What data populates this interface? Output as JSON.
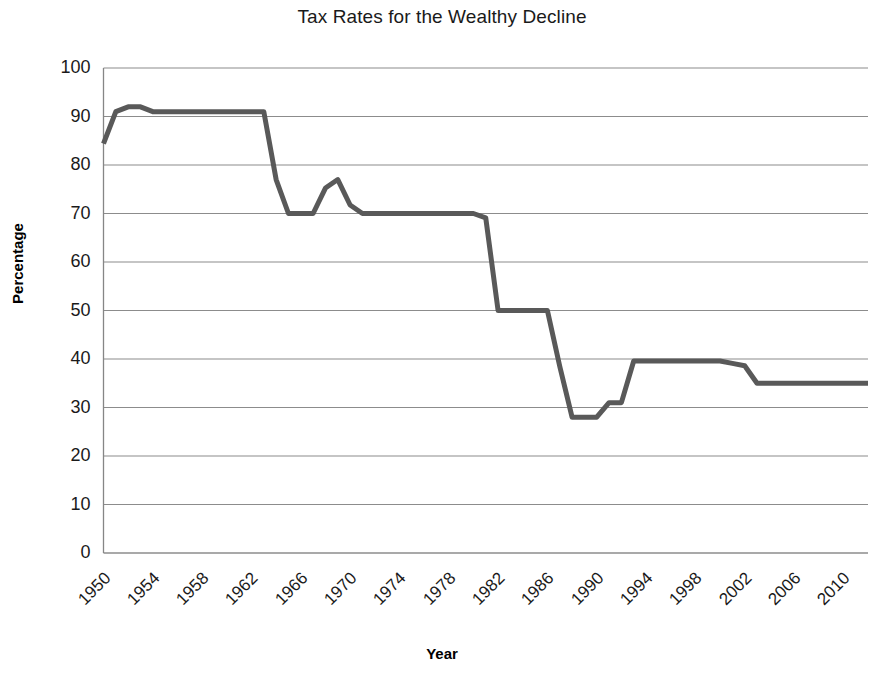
{
  "chart_data": {
    "type": "line",
    "title": "Tax Rates for the Wealthy Decline",
    "xlabel": "Year",
    "ylabel": "Percentage",
    "xlim": [
      1950,
      2012
    ],
    "ylim": [
      0,
      100
    ],
    "ytick_values": [
      0,
      10,
      20,
      30,
      40,
      50,
      60,
      70,
      80,
      90,
      100
    ],
    "ytick_labels": [
      "0",
      "10",
      "20",
      "30",
      "40",
      "50",
      "60",
      "70",
      "80",
      "90",
      "100"
    ],
    "xtick_values": [
      1950,
      1954,
      1958,
      1962,
      1966,
      1970,
      1974,
      1978,
      1982,
      1986,
      1990,
      1994,
      1998,
      2002,
      2006,
      2010
    ],
    "xtick_labels": [
      "1950",
      "1954",
      "1958",
      "1962",
      "1966",
      "1970",
      "1974",
      "1978",
      "1982",
      "1986",
      "1990",
      "1994",
      "1998",
      "2002",
      "2006",
      "2010"
    ],
    "grid": "horizontal",
    "legend": "none",
    "line_color": "#595959",
    "line_width": 5,
    "series": [
      {
        "name": "Top marginal tax rate",
        "x": [
          1950,
          1951,
          1952,
          1953,
          1954,
          1955,
          1956,
          1957,
          1958,
          1959,
          1960,
          1961,
          1962,
          1963,
          1964,
          1965,
          1966,
          1967,
          1968,
          1969,
          1970,
          1971,
          1972,
          1973,
          1974,
          1975,
          1976,
          1977,
          1978,
          1979,
          1980,
          1981,
          1982,
          1983,
          1984,
          1985,
          1986,
          1987,
          1988,
          1989,
          1990,
          1991,
          1992,
          1993,
          1994,
          1995,
          1996,
          1997,
          1998,
          1999,
          2000,
          2001,
          2002,
          2003,
          2004,
          2005,
          2006,
          2007,
          2008,
          2009,
          2010,
          2011,
          2012
        ],
        "y": [
          84.4,
          91,
          92,
          92,
          91,
          91,
          91,
          91,
          91,
          91,
          91,
          91,
          91,
          91,
          77,
          70,
          70,
          70,
          75.25,
          77,
          71.75,
          70,
          70,
          70,
          70,
          70,
          70,
          70,
          70,
          70,
          70,
          69.1,
          50,
          50,
          50,
          50,
          50,
          38.5,
          28,
          28,
          28,
          31,
          31,
          39.6,
          39.6,
          39.6,
          39.6,
          39.6,
          39.6,
          39.6,
          39.6,
          39.1,
          38.6,
          35,
          35,
          35,
          35,
          35,
          35,
          35,
          35,
          35,
          35
        ]
      }
    ]
  }
}
